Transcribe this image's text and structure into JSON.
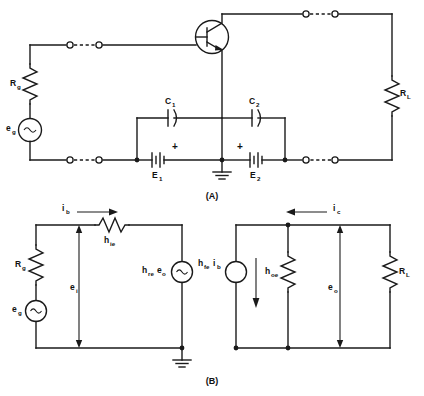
{
  "figure": {
    "captions": {
      "a": "(A)",
      "b": "(B)"
    }
  },
  "circuit_a": {
    "name": "Common-emitter transistor bias circuit",
    "components": [
      {
        "id": "rg",
        "type": "resistor",
        "label": "R",
        "sub": "g"
      },
      {
        "id": "eg",
        "type": "ac-source",
        "label": "e",
        "sub": "g",
        "glyph": "~"
      },
      {
        "id": "q1",
        "type": "npn-transistor",
        "label": "",
        "sub": ""
      },
      {
        "id": "c1",
        "type": "capacitor",
        "label": "C",
        "sub": "1"
      },
      {
        "id": "c2",
        "type": "capacitor",
        "label": "C",
        "sub": "2"
      },
      {
        "id": "e1",
        "type": "battery",
        "label": "E",
        "sub": "1",
        "polarity": "+"
      },
      {
        "id": "e2",
        "type": "battery",
        "label": "E",
        "sub": "2",
        "polarity": "+"
      },
      {
        "id": "rl",
        "type": "resistor",
        "label": "R",
        "sub": "L"
      },
      {
        "id": "gnd",
        "type": "ground",
        "label": "",
        "sub": ""
      }
    ],
    "labels": {
      "rg": "R",
      "rg_sub": "g",
      "eg": "e",
      "eg_sub": "g",
      "c1": "C",
      "c1_sub": "1",
      "c2": "C",
      "c2_sub": "2",
      "e1": "E",
      "e1_sub": "1",
      "e2": "E",
      "e2_sub": "2",
      "rl": "R",
      "rl_sub": "L",
      "plus1": "+",
      "plus2": "+",
      "source_glyph": "~"
    }
  },
  "circuit_b": {
    "name": "h-parameter small-signal equivalent circuit",
    "components": [
      {
        "id": "rg_b",
        "type": "resistor",
        "label": "R",
        "sub": "g"
      },
      {
        "id": "eg_b",
        "type": "ac-source",
        "label": "e",
        "sub": "g",
        "glyph": "~"
      },
      {
        "id": "hie",
        "type": "resistor",
        "label": "h",
        "sub": "ie"
      },
      {
        "id": "hre_eo",
        "type": "ac-source",
        "label": "h",
        "sub": "re",
        "label2": "e",
        "sub2": "o",
        "glyph": "~"
      },
      {
        "id": "hfe_ib",
        "type": "current-source",
        "label": "h",
        "sub": "fe",
        "label2": "i",
        "sub2": "b"
      },
      {
        "id": "hoe",
        "type": "resistor",
        "label": "h",
        "sub": "oe"
      },
      {
        "id": "rl_b",
        "type": "resistor",
        "label": "R",
        "sub": "L"
      },
      {
        "id": "gnd_b",
        "type": "ground",
        "label": "",
        "sub": ""
      }
    ],
    "labels": {
      "ib": "i",
      "ib_sub": "b",
      "ic": "i",
      "ic_sub": "c",
      "ei": "e",
      "ei_sub": "i",
      "eo": "e",
      "eo_sub": "o",
      "hie": "h",
      "hie_sub": "ie",
      "hoe": "h",
      "hoe_sub": "oe",
      "hre": "h",
      "hre_sub": "re",
      "hre_e": "e",
      "hre_e_sub": "o",
      "hfe": "h",
      "hfe_sub": "fe",
      "hfe_i": "i",
      "hfe_i_sub": "b",
      "rg": "R",
      "rg_sub": "g",
      "eg": "e",
      "eg_sub": "g",
      "rl": "R",
      "rl_sub": "L",
      "source_glyph": "~"
    }
  },
  "colors": {
    "line": "#1a1a1a",
    "background": "#ffffff",
    "text": "#111111"
  }
}
